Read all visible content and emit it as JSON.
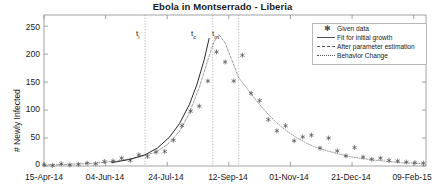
{
  "chart_data": {
    "type": "line",
    "title": "Ebola in Montserrado - Liberia",
    "xlabel": "",
    "ylabel": "# Newly Infected",
    "ylim": [
      0,
      270
    ],
    "yticks": [
      0,
      50,
      100,
      150,
      200,
      250
    ],
    "xlim_days": [
      0,
      310
    ],
    "xticks_days": [
      0,
      50,
      100,
      150,
      200,
      250,
      300
    ],
    "xticklabels": [
      "15-Apr-14",
      "04-Jun-14",
      "24-Jul-14",
      "12-Sep-14",
      "01-Nov-14",
      "21-Dec-14",
      "09-Feb-15"
    ],
    "grid": false,
    "legend_position": "top-right",
    "legend": [
      {
        "label": "Given data",
        "style": "marker-asterisk"
      },
      {
        "label": "Fit for initial growth",
        "style": "solid-line"
      },
      {
        "label": "After parameter estimation",
        "style": "dashed-line"
      },
      {
        "label": "Behavior Change",
        "style": "dotted-line"
      }
    ],
    "annotations": [
      {
        "text": "t",
        "sub": "i",
        "x_day": 82,
        "label": "t_i"
      },
      {
        "text": "t",
        "sub": "c",
        "x_day": 137,
        "label": "t_c"
      },
      {
        "text": "t",
        "sub": "m",
        "x_day": 158,
        "label": "t_m"
      }
    ],
    "vertical_lines_days": [
      82,
      137,
      158
    ],
    "series": [
      {
        "name": "Given data",
        "style": "marker-asterisk",
        "points": [
          {
            "x": 0,
            "y": 2
          },
          {
            "x": 7,
            "y": 1
          },
          {
            "x": 14,
            "y": 4
          },
          {
            "x": 21,
            "y": 2
          },
          {
            "x": 28,
            "y": 3
          },
          {
            "x": 35,
            "y": 5
          },
          {
            "x": 42,
            "y": 4
          },
          {
            "x": 49,
            "y": 8
          },
          {
            "x": 56,
            "y": 9
          },
          {
            "x": 63,
            "y": 14
          },
          {
            "x": 70,
            "y": 10
          },
          {
            "x": 77,
            "y": 20
          },
          {
            "x": 84,
            "y": 17
          },
          {
            "x": 91,
            "y": 25
          },
          {
            "x": 98,
            "y": 26
          },
          {
            "x": 105,
            "y": 46
          },
          {
            "x": 112,
            "y": 72
          },
          {
            "x": 119,
            "y": 98
          },
          {
            "x": 126,
            "y": 107
          },
          {
            "x": 133,
            "y": 152
          },
          {
            "x": 140,
            "y": 204
          },
          {
            "x": 147,
            "y": 186
          },
          {
            "x": 154,
            "y": 152
          },
          {
            "x": 161,
            "y": 198
          },
          {
            "x": 168,
            "y": 130
          },
          {
            "x": 175,
            "y": 117
          },
          {
            "x": 182,
            "y": 83
          },
          {
            "x": 189,
            "y": 63
          },
          {
            "x": 196,
            "y": 72
          },
          {
            "x": 203,
            "y": 45
          },
          {
            "x": 210,
            "y": 52
          },
          {
            "x": 217,
            "y": 55
          },
          {
            "x": 224,
            "y": 32
          },
          {
            "x": 231,
            "y": 50
          },
          {
            "x": 238,
            "y": 27
          },
          {
            "x": 245,
            "y": 18
          },
          {
            "x": 252,
            "y": 33
          },
          {
            "x": 259,
            "y": 16
          },
          {
            "x": 266,
            "y": 12
          },
          {
            "x": 273,
            "y": 14
          },
          {
            "x": 280,
            "y": 10
          },
          {
            "x": 287,
            "y": 9
          },
          {
            "x": 294,
            "y": 7
          },
          {
            "x": 301,
            "y": 6
          },
          {
            "x": 308,
            "y": 5
          }
        ]
      },
      {
        "name": "Fit for initial growth",
        "style": "solid-line",
        "points": [
          {
            "x": 55,
            "y": 6
          },
          {
            "x": 70,
            "y": 12
          },
          {
            "x": 82,
            "y": 20
          },
          {
            "x": 92,
            "y": 32
          },
          {
            "x": 102,
            "y": 52
          },
          {
            "x": 110,
            "y": 76
          },
          {
            "x": 118,
            "y": 110
          },
          {
            "x": 124,
            "y": 145
          },
          {
            "x": 130,
            "y": 190
          },
          {
            "x": 134,
            "y": 228
          }
        ]
      },
      {
        "name": "After parameter estimation",
        "style": "dashed-line",
        "points": [
          {
            "x": 0,
            "y": 2
          },
          {
            "x": 20,
            "y": 3
          },
          {
            "x": 40,
            "y": 5
          },
          {
            "x": 60,
            "y": 9
          },
          {
            "x": 75,
            "y": 15
          },
          {
            "x": 90,
            "y": 24
          },
          {
            "x": 100,
            "y": 38
          },
          {
            "x": 110,
            "y": 62
          },
          {
            "x": 118,
            "y": 95
          },
          {
            "x": 126,
            "y": 140
          },
          {
            "x": 133,
            "y": 190
          },
          {
            "x": 138,
            "y": 222
          },
          {
            "x": 142,
            "y": 235
          },
          {
            "x": 147,
            "y": 220
          },
          {
            "x": 152,
            "y": 192
          },
          {
            "x": 158,
            "y": 158
          }
        ]
      },
      {
        "name": "Behavior Change",
        "style": "dotted-line",
        "points": [
          {
            "x": 158,
            "y": 158
          },
          {
            "x": 165,
            "y": 138
          },
          {
            "x": 172,
            "y": 118
          },
          {
            "x": 180,
            "y": 97
          },
          {
            "x": 188,
            "y": 79
          },
          {
            "x": 196,
            "y": 64
          },
          {
            "x": 204,
            "y": 52
          },
          {
            "x": 212,
            "y": 42
          },
          {
            "x": 220,
            "y": 34
          },
          {
            "x": 230,
            "y": 27
          },
          {
            "x": 240,
            "y": 21
          },
          {
            "x": 250,
            "y": 16
          },
          {
            "x": 260,
            "y": 13
          },
          {
            "x": 270,
            "y": 10
          },
          {
            "x": 280,
            "y": 8
          },
          {
            "x": 290,
            "y": 6
          },
          {
            "x": 300,
            "y": 5
          },
          {
            "x": 308,
            "y": 4
          }
        ]
      }
    ]
  },
  "colors": {
    "axis": "#8c8c8c",
    "text": "#1a1a1a",
    "data_marker": "#4d4d4d",
    "fit_line": "#2b2b2b",
    "estimation_line": "#8a8a8a",
    "behavior_line": "#8a8a8a",
    "annotation_line": "#9a9a9a"
  }
}
